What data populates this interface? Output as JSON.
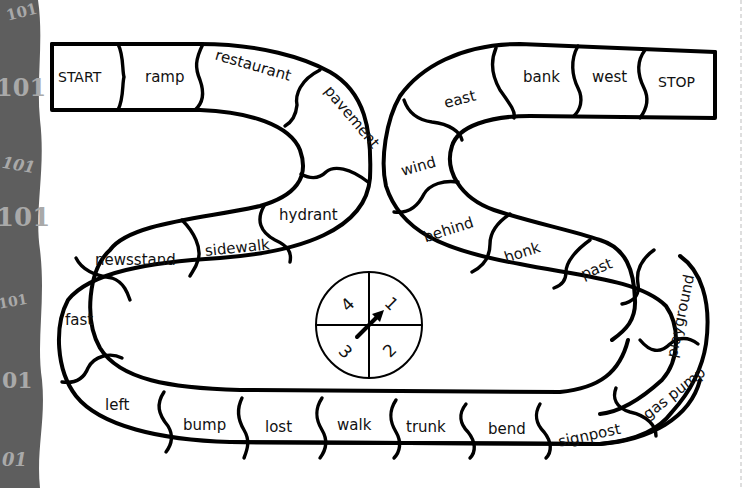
{
  "side_strip": {
    "color": "#5e5e5e",
    "glyphs": [
      "101",
      "101",
      "101",
      "101",
      "101",
      "01",
      "01"
    ]
  },
  "board": {
    "start_label": "START",
    "stop_label": "STOP",
    "spaces": [
      "ramp",
      "restaurant",
      "pavement",
      "hydrant",
      "sidewalk",
      "newsstand",
      "fast",
      "left",
      "bump",
      "lost",
      "walk",
      "trunk",
      "bend",
      "signpost",
      "gas pump",
      "playground",
      "past",
      "honk",
      "behind",
      "wind",
      "east",
      "bank",
      "west"
    ]
  },
  "spinner": {
    "numbers": [
      "1",
      "2",
      "3",
      "4"
    ],
    "pointer_direction": "toward 1"
  },
  "colors": {
    "ink": "#000000",
    "paper": "#ffffff",
    "strip": "#5e5e5e",
    "strip_text": "#a9a9a9",
    "cut_line": "#bdbdbd"
  }
}
